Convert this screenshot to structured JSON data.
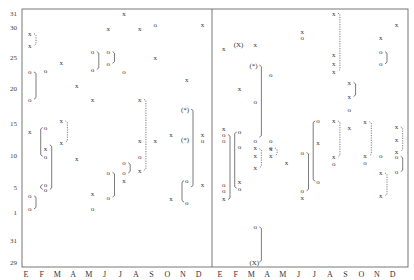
{
  "chart_data": {
    "type": "scatter",
    "title": "",
    "xlabel": "",
    "ylabel": "",
    "panels": 2,
    "categories": [
      "E",
      "F",
      "M",
      "A",
      "M",
      "J",
      "J",
      "A",
      "S",
      "O",
      "N",
      "D"
    ],
    "y_ticks": [
      {
        "label": "31",
        "value": 31
      },
      {
        "label": "30",
        "value": 30
      },
      {
        "label": "25",
        "value": 25
      },
      {
        "label": "20",
        "value": 20
      },
      {
        "label": "15",
        "value": 15
      },
      {
        "label": "10",
        "value": 10
      },
      {
        "label": "5",
        "value": 5
      },
      {
        "label": "1",
        "value": 1
      },
      {
        "label": "31",
        "value": -0.5
      },
      {
        "label": "29",
        "value": -2.5
      }
    ],
    "ylim": [
      -3,
      31.5
    ],
    "grid": false,
    "marker_symbols": {
      "x": "x",
      "o": "o",
      "X_paren": "(X)",
      "star_paren": "(*)"
    },
    "series": [
      {
        "name": "panel-1",
        "points": [
          {
            "m": 0,
            "d": 28.9,
            "s": "x"
          },
          {
            "m": 0,
            "d": 26.9,
            "s": "x"
          },
          {
            "m": 0,
            "d": 22.6,
            "s": "o"
          },
          {
            "m": 0,
            "d": 18.4,
            "s": "o"
          },
          {
            "m": 0,
            "d": 13.6,
            "s": "x"
          },
          {
            "m": 0,
            "d": 3.6,
            "s": "o"
          },
          {
            "m": 0,
            "d": 1.5,
            "s": "o"
          },
          {
            "m": 1,
            "d": 22.8,
            "s": "o"
          },
          {
            "m": 1,
            "d": 14.3,
            "s": "o"
          },
          {
            "m": 1,
            "d": 11.0,
            "s": "x"
          },
          {
            "m": 1,
            "d": 9.8,
            "s": "o"
          },
          {
            "m": 1,
            "d": 5.4,
            "s": "o"
          },
          {
            "m": 1,
            "d": 4.6,
            "s": "o"
          },
          {
            "m": 2,
            "d": 24.1,
            "s": "x"
          },
          {
            "m": 2,
            "d": 15.3,
            "s": "x"
          },
          {
            "m": 2,
            "d": 12.0,
            "s": "x"
          },
          {
            "m": 3,
            "d": 20.4,
            "s": "x"
          },
          {
            "m": 3,
            "d": 9.4,
            "s": "x"
          },
          {
            "m": 4,
            "d": 25.9,
            "s": "o"
          },
          {
            "m": 4,
            "d": 23.0,
            "s": "o"
          },
          {
            "m": 4,
            "d": 18.4,
            "s": "x"
          },
          {
            "m": 4,
            "d": 4.0,
            "s": "x"
          },
          {
            "m": 4,
            "d": 1.5,
            "s": "o"
          },
          {
            "m": 5,
            "d": 25.9,
            "s": "o"
          },
          {
            "m": 5,
            "d": 24.0,
            "s": "o"
          },
          {
            "m": 5,
            "d": 7.3,
            "s": "o"
          },
          {
            "m": 5,
            "d": 3.4,
            "s": "o"
          },
          {
            "m": 5,
            "d": 29.7,
            "s": "x"
          },
          {
            "m": 6,
            "d": 22.7,
            "s": "o"
          },
          {
            "m": 6,
            "d": 8.8,
            "s": "o"
          },
          {
            "m": 6,
            "d": 7.2,
            "s": "o"
          },
          {
            "m": 6,
            "d": 6.0,
            "s": "x"
          },
          {
            "m": 6,
            "d": 31.0,
            "s": "x"
          },
          {
            "m": 7,
            "d": 29.7,
            "s": "x"
          },
          {
            "m": 7,
            "d": 18.4,
            "s": "x"
          },
          {
            "m": 7,
            "d": 12.3,
            "s": "x"
          },
          {
            "m": 7,
            "d": 9.8,
            "s": "o"
          },
          {
            "m": 7,
            "d": 7.6,
            "s": "x"
          },
          {
            "m": 8,
            "d": 30.2,
            "s": "o"
          },
          {
            "m": 8,
            "d": 24.9,
            "s": "x"
          },
          {
            "m": 8,
            "d": 12.3,
            "s": "x"
          },
          {
            "m": 9,
            "d": 13.2,
            "s": "x"
          },
          {
            "m": 9,
            "d": 3.1,
            "s": "x"
          },
          {
            "m": 10,
            "d": 21.4,
            "s": "x"
          },
          {
            "m": 10,
            "d": 17.0,
            "s": "star_paren"
          },
          {
            "m": 10,
            "d": 12.4,
            "s": "star_paren"
          },
          {
            "m": 10,
            "d": 6.0,
            "s": "o"
          },
          {
            "m": 10,
            "d": 2.6,
            "s": "o"
          },
          {
            "m": 11,
            "d": 30.2,
            "s": "x"
          },
          {
            "m": 11,
            "d": 13.2,
            "s": "x"
          },
          {
            "m": 11,
            "d": 12.3,
            "s": "o"
          },
          {
            "m": 11,
            "d": 5.4,
            "s": "x"
          }
        ]
      },
      {
        "name": "panel-2",
        "points": [
          {
            "m": 0,
            "d": 26.4,
            "s": "x"
          },
          {
            "m": 0,
            "d": 14.1,
            "s": "x"
          },
          {
            "m": 0,
            "d": 13.2,
            "s": "o"
          },
          {
            "m": 0,
            "d": 12.3,
            "s": "o"
          },
          {
            "m": 0,
            "d": 5.4,
            "s": "o"
          },
          {
            "m": 0,
            "d": 4.4,
            "s": "o"
          },
          {
            "m": 0,
            "d": 3.1,
            "s": "x"
          },
          {
            "m": 1,
            "d": 27.1,
            "s": "X_paren"
          },
          {
            "m": 1,
            "d": 13.6,
            "s": "o"
          },
          {
            "m": 1,
            "d": 11.4,
            "s": "o"
          },
          {
            "m": 1,
            "d": 5.8,
            "s": "x"
          },
          {
            "m": 1,
            "d": 4.8,
            "s": "o"
          },
          {
            "m": 1,
            "d": 19.9,
            "s": "x"
          },
          {
            "m": 2,
            "d": 27.1,
            "s": "x"
          },
          {
            "m": 2,
            "d": 23.7,
            "s": "star_paren"
          },
          {
            "m": 2,
            "d": 18.1,
            "s": "o"
          },
          {
            "m": 2,
            "d": 12.2,
            "s": "o"
          },
          {
            "m": 2,
            "d": 11.1,
            "s": "x"
          },
          {
            "m": 2,
            "d": 9.9,
            "s": "x"
          },
          {
            "m": 2,
            "d": 8.0,
            "s": "x"
          },
          {
            "m": 2,
            "d": 0.2,
            "s": "o"
          },
          {
            "m": 2,
            "d": -2.5,
            "s": "X_paren"
          },
          {
            "m": 3,
            "d": 22.2,
            "s": "o"
          },
          {
            "m": 3,
            "d": 11.1,
            "s": "o"
          },
          {
            "m": 3,
            "d": 12.3,
            "s": "o"
          },
          {
            "m": 3,
            "d": 11.0,
            "s": "x"
          },
          {
            "m": 3,
            "d": 9.9,
            "s": "x"
          },
          {
            "m": 4,
            "d": 8.8,
            "s": "x"
          },
          {
            "m": 5,
            "d": 29.2,
            "s": "x"
          },
          {
            "m": 5,
            "d": 28.2,
            "s": "o"
          },
          {
            "m": 5,
            "d": 10.4,
            "s": "o"
          },
          {
            "m": 5,
            "d": 4.4,
            "s": "o"
          },
          {
            "m": 5,
            "d": 3.4,
            "s": "x"
          },
          {
            "m": 6,
            "d": 15.3,
            "s": "o"
          },
          {
            "m": 6,
            "d": 12.0,
            "s": "x"
          },
          {
            "m": 6,
            "d": 5.9,
            "s": "o"
          },
          {
            "m": 7,
            "d": 31.0,
            "s": "x"
          },
          {
            "m": 7,
            "d": 25.5,
            "s": "x"
          },
          {
            "m": 7,
            "d": 23.9,
            "s": "x"
          },
          {
            "m": 7,
            "d": 22.7,
            "s": "x"
          },
          {
            "m": 7,
            "d": 15.3,
            "s": "x"
          },
          {
            "m": 7,
            "d": 9.7,
            "s": "x"
          },
          {
            "m": 7,
            "d": 8.6,
            "s": "o"
          },
          {
            "m": 8,
            "d": 20.9,
            "s": "x"
          },
          {
            "m": 8,
            "d": 18.8,
            "s": "x"
          },
          {
            "m": 8,
            "d": 17.0,
            "s": "o"
          },
          {
            "m": 8,
            "d": 14.3,
            "s": "x"
          },
          {
            "m": 9,
            "d": 15.2,
            "s": "x"
          },
          {
            "m": 9,
            "d": 9.9,
            "s": "x"
          },
          {
            "m": 9,
            "d": 8.8,
            "s": "o"
          },
          {
            "m": 10,
            "d": 28.2,
            "s": "x"
          },
          {
            "m": 10,
            "d": 25.9,
            "s": "o"
          },
          {
            "m": 10,
            "d": 23.9,
            "s": "o"
          },
          {
            "m": 10,
            "d": 9.9,
            "s": "o"
          },
          {
            "m": 10,
            "d": 7.2,
            "s": "x"
          },
          {
            "m": 10,
            "d": 3.6,
            "s": "x"
          },
          {
            "m": 11,
            "d": 30.2,
            "s": "x"
          },
          {
            "m": 11,
            "d": 14.4,
            "s": "x"
          },
          {
            "m": 11,
            "d": 12.4,
            "s": "x"
          },
          {
            "m": 11,
            "d": 10.6,
            "s": "x"
          },
          {
            "m": 11,
            "d": 9.8,
            "s": "o"
          },
          {
            "m": 11,
            "d": 7.4,
            "s": "o"
          }
        ]
      }
    ],
    "brackets": [
      {
        "panel": 0,
        "m": 0,
        "from": 28.9,
        "to": 26.9,
        "style": "dashed"
      },
      {
        "panel": 0,
        "m": 0,
        "from": 22.6,
        "to": 18.4,
        "style": "solid"
      },
      {
        "panel": 0,
        "m": 0,
        "from": 3.6,
        "to": 1.5,
        "style": "solid"
      },
      {
        "panel": 0,
        "m": 1,
        "from": 14.3,
        "to": 9.8,
        "style": "solid",
        "side": "left"
      },
      {
        "panel": 0,
        "m": 1,
        "from": 11.6,
        "to": 4.6,
        "style": "solid"
      },
      {
        "panel": 0,
        "m": 1,
        "from": 5.4,
        "to": 4.6,
        "style": "solid",
        "side": "left"
      },
      {
        "panel": 0,
        "m": 2,
        "from": 15.3,
        "to": 12.0,
        "style": "dashed"
      },
      {
        "panel": 0,
        "m": 4,
        "from": 25.9,
        "to": 23.0,
        "style": "solid"
      },
      {
        "panel": 0,
        "m": 5,
        "from": 25.9,
        "to": 24.0,
        "style": "solid"
      },
      {
        "panel": 0,
        "m": 5,
        "from": 7.3,
        "to": 3.4,
        "style": "solid"
      },
      {
        "panel": 0,
        "m": 6,
        "from": 8.8,
        "to": 7.2,
        "style": "solid"
      },
      {
        "panel": 0,
        "m": 7,
        "from": 18.4,
        "to": 7.6,
        "style": "dashed"
      },
      {
        "panel": 0,
        "m": 10,
        "from": 17.0,
        "to": 5.0,
        "style": "solid"
      },
      {
        "panel": 0,
        "m": 10,
        "from": 6.0,
        "to": 2.6,
        "style": "solid",
        "side": "left"
      },
      {
        "panel": 1,
        "m": 0,
        "from": 13.2,
        "to": 3.0,
        "style": "solid"
      },
      {
        "panel": 1,
        "m": 1,
        "from": 13.6,
        "to": 4.8,
        "style": "solid",
        "side": "left"
      },
      {
        "panel": 1,
        "m": 2,
        "from": 23.7,
        "to": 12.8,
        "style": "solid"
      },
      {
        "panel": 1,
        "m": 2,
        "from": 11.0,
        "to": 8.0,
        "style": "dashed"
      },
      {
        "panel": 1,
        "m": 2,
        "from": 0.2,
        "to": -2.5,
        "style": "solid"
      },
      {
        "panel": 1,
        "m": 3,
        "from": 11.1,
        "to": 9.9,
        "style": "dashed"
      },
      {
        "panel": 1,
        "m": 5,
        "from": 10.4,
        "to": 4.4,
        "style": "solid"
      },
      {
        "panel": 1,
        "m": 6,
        "from": 15.3,
        "to": 5.9,
        "style": "solid",
        "side": "left"
      },
      {
        "panel": 1,
        "m": 7,
        "from": 31.0,
        "to": 22.7,
        "style": "dashed"
      },
      {
        "panel": 1,
        "m": 7,
        "from": 15.3,
        "to": 9.7,
        "style": "dashed"
      },
      {
        "panel": 1,
        "m": 8,
        "from": 20.9,
        "to": 18.8,
        "style": "solid"
      },
      {
        "panel": 1,
        "m": 9,
        "from": 15.2,
        "to": 9.9,
        "style": "dashed"
      },
      {
        "panel": 1,
        "m": 10,
        "from": 25.9,
        "to": 23.9,
        "style": "solid"
      },
      {
        "panel": 1,
        "m": 10,
        "from": 7.2,
        "to": 3.6,
        "style": "dashed"
      },
      {
        "panel": 1,
        "m": 11,
        "from": 14.4,
        "to": 10.6,
        "style": "dashed"
      },
      {
        "panel": 1,
        "m": 11,
        "from": 9.8,
        "to": 7.4,
        "style": "solid"
      }
    ]
  }
}
